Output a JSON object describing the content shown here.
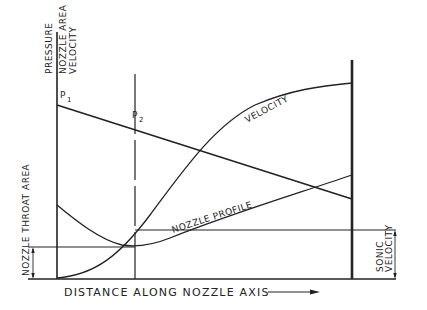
{
  "diagram": {
    "type": "nozzle-flow-diagram",
    "colors": {
      "ink": "#222222",
      "background": "#ffffff"
    },
    "y_axis_labels": [
      "PRESSURE",
      "NOZZLE AREA",
      "VELOCITY"
    ],
    "x_axis_label": "DISTANCE ALONG NOZZLE AXIS",
    "x_axis_arrow": "arrow-right-icon",
    "point_labels": {
      "p1": {
        "base": "P",
        "sub": "1"
      },
      "p2": {
        "base": "P",
        "sub": "2"
      }
    },
    "curve_labels": {
      "velocity": "VELOCITY",
      "nozzle_profile": "NOZZLE PROFILE"
    },
    "dimension_labels": {
      "throat_area": "NOZZLE THROAT AREA",
      "sonic_velocity_line1": "SONIC",
      "sonic_velocity_line2": "VELOCITY"
    },
    "curves": {
      "pressure": "straight line falling from P1 at inlet to lower value at exit",
      "velocity": "rising curve from zero at inlet, reaching sonic velocity at throat, continuing to increase to exit",
      "nozzle_profile": "converging-diverging curve with minimum (throat) at P2 location"
    }
  }
}
